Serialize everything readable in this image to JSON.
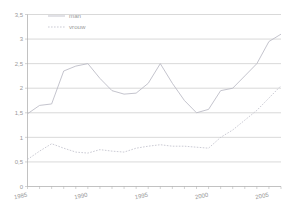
{
  "chart_data": {
    "type": "line",
    "title": "",
    "xlabel": "",
    "ylabel": "",
    "xlim": [
      1985,
      2006
    ],
    "ylim": [
      0,
      3.5
    ],
    "grid": true,
    "legend_position": "top-left",
    "y_ticks": [
      "0",
      "0,5",
      "1",
      "1,5",
      "2",
      "2,5",
      "3",
      "3,5"
    ],
    "y_tick_values": [
      0,
      0.5,
      1,
      1.5,
      2,
      2.5,
      3,
      3.5
    ],
    "x_ticks": [
      "1985",
      "1990",
      "1995",
      "2000",
      "2005"
    ],
    "x_tick_values": [
      1985,
      1990,
      1995,
      2000,
      2005
    ],
    "x": [
      1985,
      1986,
      1987,
      1988,
      1989,
      1990,
      1991,
      1992,
      1993,
      1994,
      1995,
      1996,
      1997,
      1998,
      1999,
      2000,
      2001,
      2002,
      2003,
      2004,
      2005,
      2006
    ],
    "series": [
      {
        "name": "man",
        "style": "solid",
        "color": "#b9b9c4",
        "values": [
          1.48,
          1.65,
          1.68,
          2.35,
          2.45,
          2.5,
          2.2,
          1.95,
          1.88,
          1.9,
          2.1,
          2.5,
          2.1,
          1.75,
          1.5,
          1.57,
          1.95,
          2.0,
          2.25,
          2.5,
          2.95,
          3.1
        ]
      },
      {
        "name": "vrouw",
        "style": "dotted",
        "color": "#c2c2cc",
        "values": [
          0.55,
          0.72,
          0.87,
          0.78,
          0.7,
          0.68,
          0.75,
          0.72,
          0.7,
          0.78,
          0.82,
          0.85,
          0.82,
          0.82,
          0.8,
          0.78,
          1.0,
          1.15,
          1.35,
          1.55,
          1.8,
          2.05
        ]
      }
    ]
  },
  "legend": {
    "items": [
      {
        "label": "man",
        "style": "solid"
      },
      {
        "label": "vrouw",
        "style": "dotted"
      }
    ]
  }
}
